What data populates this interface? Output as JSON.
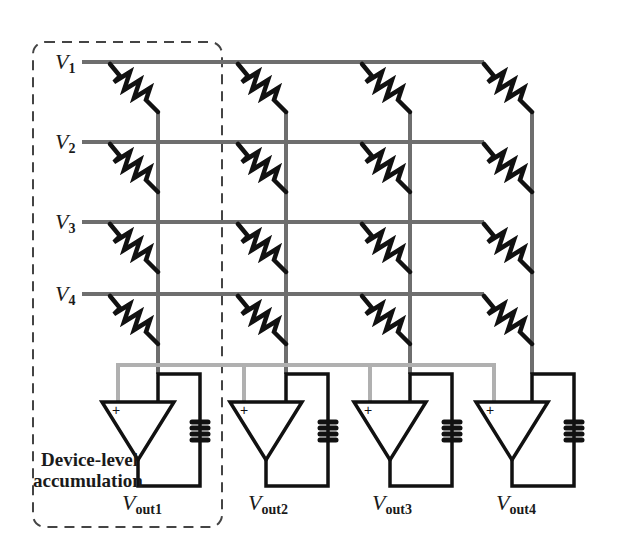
{
  "diagram": {
    "type": "crossbar-array-schematic",
    "inputs": [
      {
        "label": "V",
        "subscript": "1"
      },
      {
        "label": "V",
        "subscript": "2"
      },
      {
        "label": "V",
        "subscript": "3"
      },
      {
        "label": "V",
        "subscript": "4"
      }
    ],
    "outputs": [
      {
        "label": "V",
        "subscript": "out1"
      },
      {
        "label": "V",
        "subscript": "out2"
      },
      {
        "label": "V",
        "subscript": "out3"
      },
      {
        "label": "V",
        "subscript": "out4"
      }
    ],
    "annotation": {
      "line1": "Device-level",
      "line2": "accumulation"
    },
    "opamp_pins": {
      "plus": "+",
      "minus": "-"
    },
    "colors": {
      "wire": "#6e6e6e",
      "bus": "#b0b0b0",
      "component": "#111111",
      "dashed_box": "#444444"
    }
  }
}
